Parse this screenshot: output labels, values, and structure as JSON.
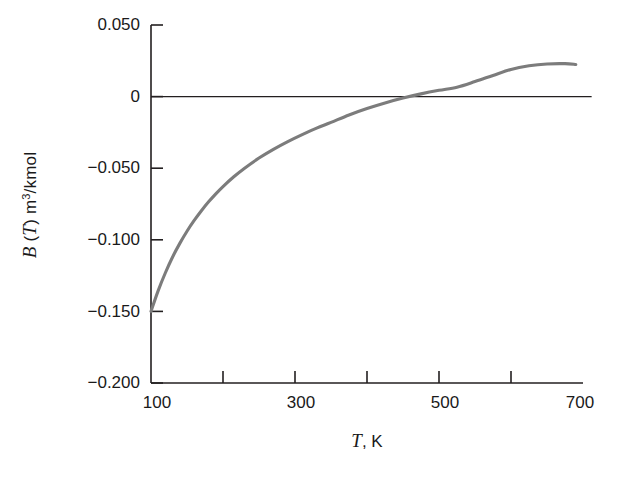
{
  "chart_data": {
    "type": "line",
    "title": "",
    "subtitle": "",
    "xlabel": "T, K",
    "xlabel_italic_part": "T",
    "xlabel_rest": ", K",
    "ylabel": "B (T) m3/kmol",
    "ylabel_italic_b": "B",
    "ylabel_paren_open": " (",
    "ylabel_italic_t": "T",
    "ylabel_paren_close": ") m",
    "ylabel_sup": "3",
    "ylabel_tail": "/kmol",
    "xlim": [
      100,
      700
    ],
    "ylim": [
      -0.2,
      0.05
    ],
    "grid": false,
    "legend": null,
    "series_color": "#7c7c7c",
    "axis_color": "#231f20",
    "x_ticks": [
      100,
      200,
      300,
      400,
      500,
      600,
      700
    ],
    "x_tick_labels": [
      "100",
      "",
      "300",
      "",
      "500",
      "",
      "700"
    ],
    "x_labeled_ticks": [
      {
        "value": 100,
        "label": "100"
      },
      {
        "value": 300,
        "label": "300"
      },
      {
        "value": 500,
        "label": "500"
      },
      {
        "value": 700,
        "label": "700"
      }
    ],
    "y_ticks": [
      0.05,
      0,
      -0.05,
      -0.1,
      -0.15,
      -0.2
    ],
    "y_tick_labels": [
      "0.050",
      "0",
      "−0.050",
      "−0.100",
      "−0.150",
      "−0.200"
    ],
    "zero_reference_line": {
      "y": 0,
      "x_from": 100,
      "x_to": 712,
      "color": "#231f20"
    },
    "series": [
      {
        "name": "B(T)",
        "color": "#7c7c7c",
        "x": [
          100,
          110,
          120,
          130,
          140,
          150,
          160,
          170,
          180,
          190,
          200,
          215,
          230,
          250,
          270,
          290,
          310,
          330,
          350,
          375,
          400,
          425,
          450,
          475,
          500,
          525,
          550,
          575,
          600,
          625,
          650,
          675,
          690
        ],
        "y": [
          -0.15,
          -0.1355,
          -0.123,
          -0.112,
          -0.1025,
          -0.094,
          -0.0865,
          -0.0797,
          -0.0735,
          -0.0679,
          -0.0628,
          -0.056,
          -0.05,
          -0.0429,
          -0.0368,
          -0.0314,
          -0.0265,
          -0.022,
          -0.018,
          -0.0128,
          -0.0083,
          -0.0044,
          -0.001,
          0.0019,
          0.0044,
          0.0066,
          0.0105,
          0.0148,
          0.019,
          0.0215,
          0.0228,
          0.023,
          0.0224
        ]
      }
    ],
    "annotations": []
  },
  "axis_geometry": {
    "plot_left_px": 151,
    "plot_right_px": 583,
    "plot_top_px": 25,
    "plot_bottom_px": 383
  }
}
